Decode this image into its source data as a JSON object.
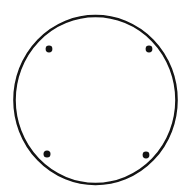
{
  "figure": {
    "canvas": {
      "width": 193,
      "height": 194,
      "background_color": "#ffffff"
    },
    "outline_circle": {
      "label": "outer circle outline",
      "center_x": 95.5,
      "center_y": 100,
      "radius_x": 81,
      "radius_y": 84,
      "stroke_color": "#141414",
      "stroke_width": 2.6,
      "fill": "none"
    },
    "dot_style": {
      "fill_color": "#111111",
      "radius": 3.4
    },
    "dots": [
      {
        "name": "top-left-dot",
        "cx": 49,
        "cy": 49,
        "r": 3.4
      },
      {
        "name": "top-right-dot",
        "cx": 149,
        "cy": 49,
        "r": 3.4
      },
      {
        "name": "bottom-left-dot",
        "cx": 47,
        "cy": 154,
        "r": 3.5
      },
      {
        "name": "bottom-right-dot",
        "cx": 146,
        "cy": 155,
        "r": 3.4
      }
    ]
  },
  "chart_data": {
    "type": "scatter",
    "xlabel": "",
    "ylabel": "",
    "xlim": [
      0,
      193
    ],
    "ylim": [
      0,
      194
    ],
    "grid": false,
    "legend": "none",
    "series": [
      {
        "name": "interior dots",
        "marker": "filled-circle",
        "color": "#111111",
        "x": [
          49,
          149,
          47,
          146
        ],
        "y": [
          49,
          49,
          154,
          155
        ]
      }
    ],
    "shapes": [
      {
        "name": "outer circle",
        "type": "ellipse",
        "cx": 95.5,
        "cy": 100,
        "rx": 81,
        "ry": 84,
        "stroke": "#141414",
        "stroke_width": 2.6,
        "fill": "none"
      }
    ]
  }
}
